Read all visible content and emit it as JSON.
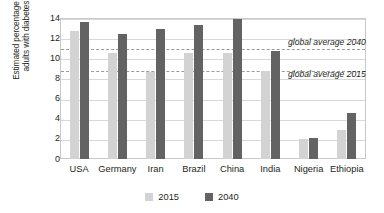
{
  "chart_data": {
    "type": "bar",
    "title": "",
    "xlabel": "",
    "ylabel_line1": "Estimated percentage of",
    "ylabel_line2": "adults with diabetes",
    "ylim": [
      0,
      14
    ],
    "yticks": [
      14,
      12,
      10,
      8,
      6,
      4,
      2,
      0
    ],
    "grid": true,
    "legend_position": "bottom",
    "categories": [
      "USA",
      "Germany",
      "Iran",
      "Brazil",
      "China",
      "India",
      "Nigeria",
      "Ethiopia"
    ],
    "series": [
      {
        "name": "2015",
        "color": "#d3d3d3",
        "values": [
          12.7,
          10.5,
          8.6,
          10.5,
          10.5,
          8.7,
          2.0,
          2.9
        ]
      },
      {
        "name": "2040",
        "color": "#636363",
        "values": [
          13.6,
          12.4,
          12.9,
          13.3,
          13.9,
          10.7,
          2.1,
          4.6
        ]
      }
    ],
    "reference_lines": [
      {
        "label": "global average 2040",
        "value": 11.0,
        "style": "dashed"
      },
      {
        "label": "global average 2015",
        "value": 8.8,
        "style": "dashed"
      }
    ]
  }
}
